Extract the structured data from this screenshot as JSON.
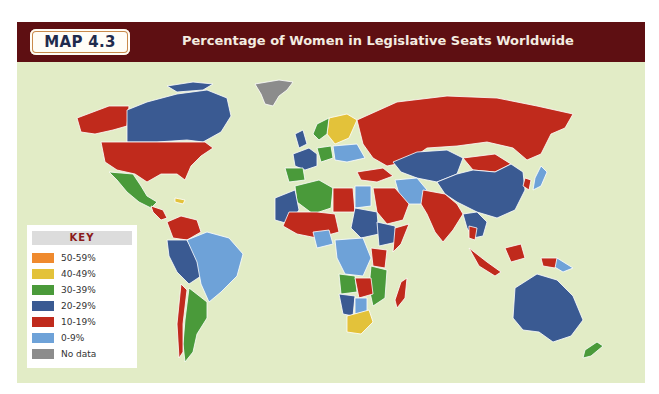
{
  "header": {
    "badge": "MAP 4.3",
    "title": "Percentage of Women in Legislative Seats Worldwide",
    "bg_color": "#5e0f12"
  },
  "map": {
    "ocean_color": "#e2ecc6",
    "regions": [
      {
        "name": "Greenland",
        "category": "No data"
      },
      {
        "name": "Alaska / United States",
        "category": "10-19%"
      },
      {
        "name": "Canada",
        "category": "20-29%"
      },
      {
        "name": "Mexico",
        "category": "30-39%"
      },
      {
        "name": "Brazil",
        "category": "0-9%"
      },
      {
        "name": "Argentina",
        "category": "30-39%"
      },
      {
        "name": "Russia",
        "category": "10-19%"
      },
      {
        "name": "China",
        "category": "20-29%"
      },
      {
        "name": "India",
        "category": "10-19%"
      },
      {
        "name": "Australia",
        "category": "20-29%"
      },
      {
        "name": "New Zealand",
        "category": "30-39%"
      },
      {
        "name": "Sweden / Finland",
        "category": "40-49%"
      },
      {
        "name": "South Africa",
        "category": "40-49%"
      },
      {
        "name": "Algeria",
        "category": "30-39%"
      },
      {
        "name": "Angola",
        "category": "30-39%"
      },
      {
        "name": "Mozambique",
        "category": "30-39%"
      },
      {
        "name": "Madagascar",
        "category": "10-19%"
      },
      {
        "name": "Indonesia",
        "category": "10-19%"
      },
      {
        "name": "Iran",
        "category": "0-9%"
      },
      {
        "name": "Japan",
        "category": "0-9%"
      },
      {
        "name": "Saudi Arabia",
        "category": "10-19%"
      },
      {
        "name": "Egypt",
        "category": "0-9%"
      }
    ]
  },
  "key": {
    "title": "KEY",
    "items": [
      {
        "label": "50-59%",
        "color": "#ef8a2e"
      },
      {
        "label": "40-49%",
        "color": "#e3c23a"
      },
      {
        "label": "30-39%",
        "color": "#4a9a3a"
      },
      {
        "label": "20-29%",
        "color": "#3a5a92"
      },
      {
        "label": "10-19%",
        "color": "#c02a1c"
      },
      {
        "label": "0-9%",
        "color": "#6ea2d8"
      },
      {
        "label": "No data",
        "color": "#8c8c8c"
      }
    ]
  }
}
